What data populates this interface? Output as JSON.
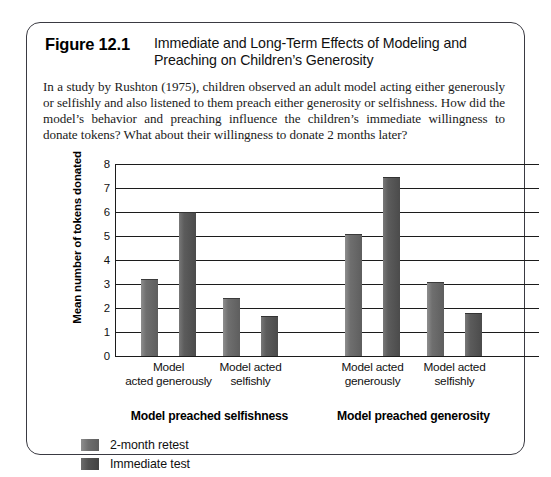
{
  "figure": {
    "number": "Figure 12.1",
    "title": "Immediate and Long-Term Effects of Modeling and Preaching on Children’s Generosity",
    "caption": "In a study by Rushton (1975), children observed an adult model acting either generously or selfishly and also listened to them preach either generosity or selfishness. How did the model’s behavior and preaching influence the children’s immediate willingness to donate tokens? What about their willingness to donate 2 months later?"
  },
  "chart_data": {
    "type": "bar",
    "title": "Immediate and Long-Term Effects of Modeling and Preaching on Children’s Generosity",
    "xlabel": "",
    "ylabel": "Mean number of tokens donated",
    "ylim": [
      0,
      8
    ],
    "yticks": [
      "0",
      "1",
      "2",
      "3",
      "4",
      "5",
      "6",
      "7",
      "8"
    ],
    "grid": true,
    "legend_position": "bottom-left",
    "categories": [
      "Model acted generously",
      "Model acted selfishly",
      "Model acted generously",
      "Model acted selfishly"
    ],
    "groups": [
      {
        "label": "Model preached selfishness",
        "categories": [
          "Model acted generously",
          "Model acted selfishly"
        ]
      },
      {
        "label": "Model preached generosity",
        "categories": [
          "Model acted generously",
          "Model acted selfishly"
        ]
      }
    ],
    "series": [
      {
        "name": "2-month retest",
        "color": "#6f6f6f",
        "values": [
          3.2,
          2.4,
          5.1,
          3.1
        ]
      },
      {
        "name": "Immediate test",
        "color": "#4f4f4f",
        "values": [
          6.0,
          1.65,
          7.45,
          1.8
        ]
      }
    ],
    "bars": [
      {
        "label": "Model preached selfishness / Model acted generously / 2-month retest",
        "series": "2-month retest",
        "value": 3.2
      },
      {
        "label": "Model preached selfishness / Model acted generously / Immediate test",
        "series": "Immediate test",
        "value": 6.0
      },
      {
        "label": "Model preached selfishness / Model acted selfishly / 2-month retest",
        "series": "2-month retest",
        "value": 2.4
      },
      {
        "label": "Model preached selfishness / Model acted selfishly / Immediate test",
        "series": "Immediate test",
        "value": 1.65
      },
      {
        "label": "Model preached generosity / Model acted generously / 2-month retest",
        "series": "2-month retest",
        "value": 5.1
      },
      {
        "label": "Model preached generosity / Model acted generously / Immediate test",
        "series": "Immediate test",
        "value": 7.45
      },
      {
        "label": "Model preached generosity / Model acted selfishly / 2-month retest",
        "series": "2-month retest",
        "value": 3.1
      },
      {
        "label": "Model preached generosity / Model acted selfishly / Immediate test",
        "series": "Immediate test",
        "value": 1.8
      }
    ]
  },
  "axis": {
    "y_title": "Mean number of tokens donated",
    "ticks": [
      "8",
      "7",
      "6",
      "5",
      "4",
      "3",
      "2",
      "1",
      "0"
    ]
  },
  "x_labels": [
    "Model\nacted generously",
    "Model acted\nselfishly",
    "Model acted\ngenerously",
    "Model acted\nselfishly"
  ],
  "group_labels": [
    "Model preached selfishness",
    "Model preached generosity"
  ],
  "legend": [
    {
      "label": "2-month retest",
      "swatch": "retest"
    },
    {
      "label": "Immediate test",
      "swatch": "immediate"
    }
  ]
}
